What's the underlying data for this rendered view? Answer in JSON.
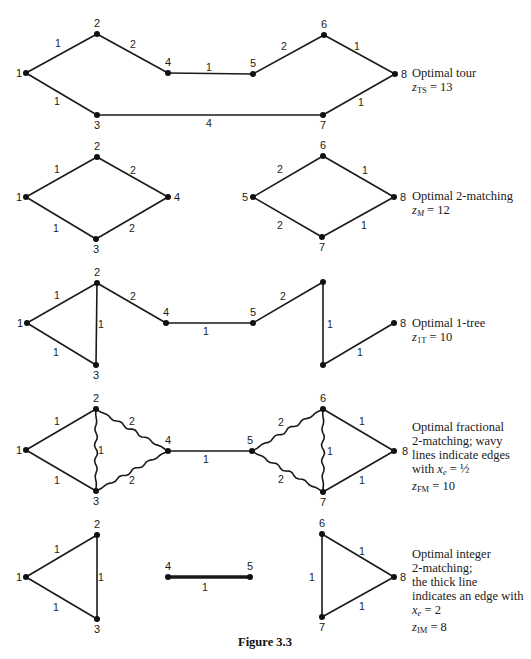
{
  "figure": {
    "title": "Figure 3.3",
    "panels": [
      {
        "id": "tour",
        "caption_lines": [
          "Optimal tour"
        ],
        "objective": {
          "var": "z",
          "sub": "TS",
          "value": "13"
        },
        "nodes": [
          {
            "id": "1",
            "x": 26,
            "y": 73,
            "lx": -10,
            "ly": 4
          },
          {
            "id": "2",
            "x": 97,
            "y": 34,
            "lx": -3,
            "ly": -7
          },
          {
            "id": "3",
            "x": 97,
            "y": 115,
            "lx": -3,
            "ly": 14
          },
          {
            "id": "4",
            "x": 168,
            "y": 73,
            "lx": -3,
            "ly": -7
          },
          {
            "id": "5",
            "x": 253,
            "y": 74,
            "lx": -3,
            "ly": -7
          },
          {
            "id": "6",
            "x": 324,
            "y": 35,
            "lx": -3,
            "ly": -7
          },
          {
            "id": "7",
            "x": 323,
            "y": 115,
            "lx": -3,
            "ly": 14
          },
          {
            "id": "8",
            "x": 395,
            "y": 74,
            "lx": 6,
            "ly": 4
          }
        ],
        "edges": [
          {
            "from": "1",
            "to": "2",
            "w": "1",
            "lx": 58,
            "ly": 47,
            "style": "normal"
          },
          {
            "from": "2",
            "to": "4",
            "w": "2",
            "lx": 133,
            "ly": 48,
            "style": "normal"
          },
          {
            "from": "4",
            "to": "5",
            "w": "1",
            "lx": 209,
            "ly": 71,
            "style": "normal"
          },
          {
            "from": "5",
            "to": "6",
            "w": "2",
            "lx": 284,
            "ly": 50,
            "style": "normal"
          },
          {
            "from": "6",
            "to": "8",
            "w": "1",
            "lx": 357,
            "ly": 50,
            "style": "normal"
          },
          {
            "from": "1",
            "to": "3",
            "w": "1",
            "lx": 57,
            "ly": 105,
            "style": "normal"
          },
          {
            "from": "3",
            "to": "7",
            "w": "4",
            "lx": 209,
            "ly": 127,
            "style": "normal"
          },
          {
            "from": "7",
            "to": "8",
            "w": "1",
            "lx": 361,
            "ly": 106,
            "style": "normal"
          }
        ],
        "caption_top": 66
      },
      {
        "id": "two-matching",
        "caption_lines": [
          "Optimal 2-matching"
        ],
        "objective": {
          "var": "z",
          "sub": "M",
          "sub_italic": true,
          "value": "12"
        },
        "nodes": [
          {
            "id": "1",
            "x": 26,
            "y": 197,
            "lx": -10,
            "ly": 4
          },
          {
            "id": "2",
            "x": 97,
            "y": 157,
            "lx": -3,
            "ly": -7
          },
          {
            "id": "3",
            "x": 96,
            "y": 239,
            "lx": -3,
            "ly": 14
          },
          {
            "id": "4",
            "x": 168,
            "y": 197,
            "lx": 6,
            "ly": 4
          },
          {
            "id": "5",
            "x": 253,
            "y": 197,
            "lx": -11,
            "ly": 4
          },
          {
            "id": "6",
            "x": 323,
            "y": 156,
            "lx": -3,
            "ly": -7
          },
          {
            "id": "7",
            "x": 322,
            "y": 237,
            "lx": -3,
            "ly": 14
          },
          {
            "id": "8",
            "x": 394,
            "y": 197,
            "lx": 6,
            "ly": 4
          }
        ],
        "edges": [
          {
            "from": "1",
            "to": "2",
            "w": "1",
            "lx": 57,
            "ly": 173,
            "style": "normal"
          },
          {
            "from": "2",
            "to": "4",
            "w": "2",
            "lx": 133,
            "ly": 174,
            "style": "normal"
          },
          {
            "from": "1",
            "to": "3",
            "w": "1",
            "lx": 56,
            "ly": 232,
            "style": "normal"
          },
          {
            "from": "3",
            "to": "4",
            "w": "2",
            "lx": 132,
            "ly": 232,
            "style": "normal"
          },
          {
            "from": "5",
            "to": "6",
            "w": "2",
            "lx": 280,
            "ly": 173,
            "style": "normal"
          },
          {
            "from": "6",
            "to": "8",
            "w": "1",
            "lx": 365,
            "ly": 174,
            "style": "normal"
          },
          {
            "from": "5",
            "to": "7",
            "w": "2",
            "lx": 280,
            "ly": 229,
            "style": "normal"
          },
          {
            "from": "7",
            "to": "8",
            "w": "1",
            "lx": 364,
            "ly": 229,
            "style": "normal"
          }
        ],
        "caption_top": 189
      },
      {
        "id": "one-tree",
        "caption_lines": [
          "Optimal 1-tree"
        ],
        "objective": {
          "var": "z",
          "sub": "1T",
          "value": "10"
        },
        "nodes": [
          {
            "id": "1",
            "x": 27,
            "y": 323,
            "lx": -10,
            "ly": 4
          },
          {
            "id": "2",
            "x": 97,
            "y": 283,
            "lx": -3,
            "ly": -7
          },
          {
            "id": "3",
            "x": 96,
            "y": 365,
            "lx": -3,
            "ly": 14
          },
          {
            "id": "4",
            "x": 166,
            "y": 323,
            "lx": -3,
            "ly": -7
          },
          {
            "id": "5",
            "x": 253,
            "y": 323,
            "lx": -3,
            "ly": -7
          },
          {
            "id": "6",
            "x": 323,
            "y": 282,
            "lx": 0,
            "ly": 0,
            "hide_label": true
          },
          {
            "id": "7",
            "x": 323,
            "y": 365,
            "lx": 0,
            "ly": 0,
            "hide_label": true
          },
          {
            "id": "8",
            "x": 394,
            "y": 323,
            "lx": 6,
            "ly": 4
          }
        ],
        "edges": [
          {
            "from": "1",
            "to": "2",
            "w": "1",
            "lx": 57,
            "ly": 299,
            "style": "normal"
          },
          {
            "from": "2",
            "to": "3",
            "w": "1",
            "lx": 101,
            "ly": 328,
            "style": "normal"
          },
          {
            "from": "1",
            "to": "3",
            "w": "1",
            "lx": 56,
            "ly": 356,
            "style": "normal"
          },
          {
            "from": "2",
            "to": "4",
            "w": "2",
            "lx": 133,
            "ly": 300,
            "style": "normal"
          },
          {
            "from": "4",
            "to": "5",
            "w": "1",
            "lx": 206,
            "ly": 335,
            "style": "normal"
          },
          {
            "from": "5",
            "to": "6",
            "w": "2",
            "lx": 283,
            "ly": 300,
            "style": "normal"
          },
          {
            "from": "6",
            "to": "7",
            "w": "1",
            "lx": 330,
            "ly": 328,
            "style": "normal"
          },
          {
            "from": "7",
            "to": "8",
            "w": "1",
            "lx": 360,
            "ly": 356,
            "style": "normal"
          }
        ],
        "caption_top": 316
      },
      {
        "id": "fractional-two-matching",
        "caption_lines": [
          "Optimal fractional",
          "2-matching; wavy",
          "lines indicate edges"
        ],
        "xe_line": {
          "prefix": "with ",
          "var": "x",
          "sub": "e",
          "eq": " = ",
          "value": "½"
        },
        "objective": {
          "var": "z",
          "sub": "FM",
          "value": "10"
        },
        "nodes": [
          {
            "id": "1",
            "x": 26,
            "y": 450,
            "lx": -10,
            "ly": 4
          },
          {
            "id": "2",
            "x": 96,
            "y": 409,
            "lx": -3,
            "ly": -7
          },
          {
            "id": "3",
            "x": 96,
            "y": 491,
            "lx": -3,
            "ly": 14
          },
          {
            "id": "4",
            "x": 168,
            "y": 451,
            "lx": -3,
            "ly": -7
          },
          {
            "id": "5",
            "x": 252,
            "y": 451,
            "lx": -5,
            "ly": -7
          },
          {
            "id": "6",
            "x": 323,
            "y": 409,
            "lx": -3,
            "ly": -7
          },
          {
            "id": "7",
            "x": 323,
            "y": 492,
            "lx": -3,
            "ly": 14
          },
          {
            "id": "8",
            "x": 394,
            "y": 451,
            "lx": 8,
            "ly": 4
          }
        ],
        "edges": [
          {
            "from": "1",
            "to": "2",
            "w": "1",
            "lx": 57,
            "ly": 425,
            "style": "normal"
          },
          {
            "from": "1",
            "to": "3",
            "w": "1",
            "lx": 57,
            "ly": 484,
            "style": "normal"
          },
          {
            "from": "2",
            "to": "3",
            "w": "1",
            "lx": 101,
            "ly": 454,
            "style": "wavy"
          },
          {
            "from": "2",
            "to": "4",
            "w": "2",
            "lx": 132,
            "ly": 425,
            "style": "wavy"
          },
          {
            "from": "3",
            "to": "4",
            "w": "2",
            "lx": 132,
            "ly": 484,
            "style": "wavy"
          },
          {
            "from": "4",
            "to": "5",
            "w": "1",
            "lx": 206,
            "ly": 463,
            "style": "normal"
          },
          {
            "from": "5",
            "to": "6",
            "w": "2",
            "lx": 281,
            "ly": 426,
            "style": "wavy"
          },
          {
            "from": "5",
            "to": "7",
            "w": "2",
            "lx": 281,
            "ly": 483,
            "style": "wavy"
          },
          {
            "from": "6",
            "to": "7",
            "w": "1",
            "lx": 330,
            "ly": 455,
            "style": "wavy"
          },
          {
            "from": "6",
            "to": "8",
            "w": "1",
            "lx": 362,
            "ly": 425,
            "style": "normal"
          },
          {
            "from": "7",
            "to": "8",
            "w": "1",
            "lx": 362,
            "ly": 484,
            "style": "normal"
          }
        ],
        "caption_top": 420
      },
      {
        "id": "integer-two-matching",
        "caption_lines": [
          "Optimal integer",
          "2-matching;",
          "the thick line",
          "indicates an edge with"
        ],
        "xe_line": {
          "prefix": "",
          "var": "x",
          "sub": "e",
          "eq": " = ",
          "value": "2"
        },
        "objective": {
          "var": "z",
          "sub": "IM",
          "value": "8"
        },
        "nodes": [
          {
            "id": "1",
            "x": 26,
            "y": 577,
            "lx": -10,
            "ly": 4
          },
          {
            "id": "2",
            "x": 97,
            "y": 535,
            "lx": -3,
            "ly": -7
          },
          {
            "id": "3",
            "x": 97,
            "y": 619,
            "lx": -3,
            "ly": 14
          },
          {
            "id": "4",
            "x": 168,
            "y": 577,
            "lx": -3,
            "ly": -7
          },
          {
            "id": "5",
            "x": 250,
            "y": 577,
            "lx": -3,
            "ly": -7
          },
          {
            "id": "6",
            "x": 322,
            "y": 534,
            "lx": -3,
            "ly": -7
          },
          {
            "id": "7",
            "x": 322,
            "y": 617,
            "lx": -3,
            "ly": 14
          },
          {
            "id": "8",
            "x": 394,
            "y": 577,
            "lx": 6,
            "ly": 4
          }
        ],
        "edges": [
          {
            "from": "1",
            "to": "2",
            "w": "1",
            "lx": 57,
            "ly": 553,
            "style": "normal"
          },
          {
            "from": "2",
            "to": "3",
            "w": "1",
            "lx": 101,
            "ly": 581,
            "style": "normal"
          },
          {
            "from": "1",
            "to": "3",
            "w": "1",
            "lx": 56,
            "ly": 611,
            "style": "normal"
          },
          {
            "from": "4",
            "to": "5",
            "w": "1",
            "lx": 205,
            "ly": 591,
            "style": "thick"
          },
          {
            "from": "6",
            "to": "7",
            "w": "1",
            "lx": 312,
            "ly": 581,
            "style": "normal"
          },
          {
            "from": "6",
            "to": "8",
            "w": "1",
            "lx": 362,
            "ly": 555,
            "style": "normal"
          },
          {
            "from": "7",
            "to": "8",
            "w": "1",
            "lx": 362,
            "ly": 610,
            "style": "normal"
          }
        ],
        "caption_top": 547
      }
    ]
  }
}
